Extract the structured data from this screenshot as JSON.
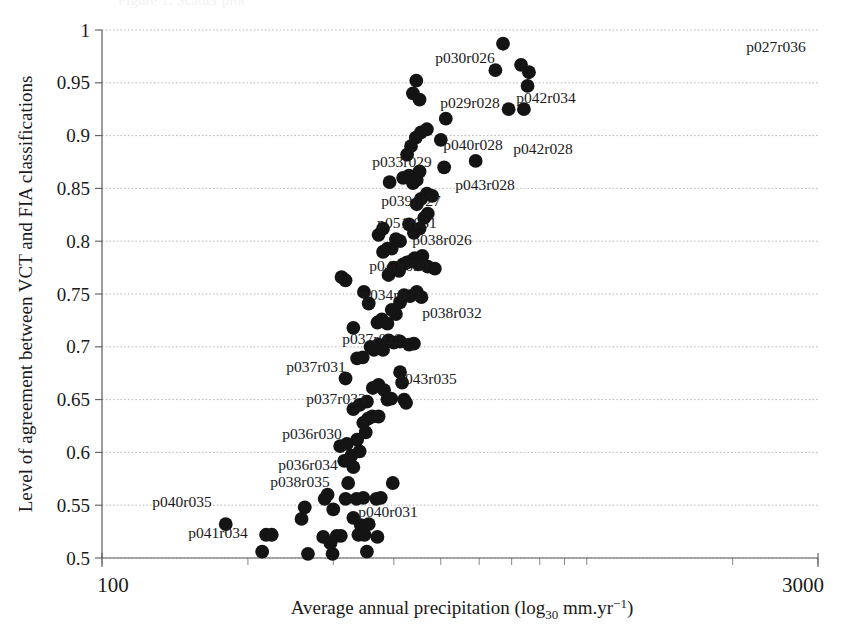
{
  "chart_data": {
    "type": "scatter",
    "title": "",
    "xlabel": "Average annual precipitation (log30 mm.yr-1)",
    "xlabel_parts": {
      "pre": "Average annual precipitation (log",
      "sub": "30",
      "mid": " mm.yr",
      "sup": "−1",
      "post": ")"
    },
    "ylabel": "Level of agreement between VCT and FIA classifications",
    "xscale": "log",
    "xlim": [
      100,
      3000
    ],
    "ylim": [
      0.5,
      1.0
    ],
    "xticks": [
      100,
      3000
    ],
    "xtick_labels": [
      "100",
      "3000"
    ],
    "yticks": [
      0.5,
      0.55,
      0.6,
      0.65,
      0.7,
      0.75,
      0.8,
      0.85,
      0.9,
      0.95,
      1
    ],
    "ytick_labels": [
      "0.5",
      "0.55",
      "0.6",
      "0.65",
      "0.7",
      "0.75",
      "0.8",
      "0.85",
      "0.9",
      "0.95",
      "1"
    ],
    "grid": true,
    "grid_axis": "y",
    "legend": null,
    "marker": {
      "shape": "circle",
      "color": "#141414",
      "size": 7.4
    },
    "points": [
      {
        "x": 180,
        "y": 0.532
      },
      {
        "x": 218,
        "y": 0.522
      },
      {
        "x": 224,
        "y": 0.522
      },
      {
        "x": 214,
        "y": 0.506
      },
      {
        "x": 262,
        "y": 0.548
      },
      {
        "x": 258,
        "y": 0.537
      },
      {
        "x": 266,
        "y": 0.504
      },
      {
        "x": 288,
        "y": 0.556
      },
      {
        "x": 292,
        "y": 0.56
      },
      {
        "x": 300,
        "y": 0.546
      },
      {
        "x": 286,
        "y": 0.52
      },
      {
        "x": 296,
        "y": 0.514
      },
      {
        "x": 305,
        "y": 0.521
      },
      {
        "x": 311,
        "y": 0.521
      },
      {
        "x": 299,
        "y": 0.504
      },
      {
        "x": 322,
        "y": 0.571
      },
      {
        "x": 330,
        "y": 0.586
      },
      {
        "x": 318,
        "y": 0.556
      },
      {
        "x": 335,
        "y": 0.556
      },
      {
        "x": 346,
        "y": 0.557
      },
      {
        "x": 330,
        "y": 0.538
      },
      {
        "x": 342,
        "y": 0.531
      },
      {
        "x": 355,
        "y": 0.532
      },
      {
        "x": 338,
        "y": 0.522
      },
      {
        "x": 348,
        "y": 0.522
      },
      {
        "x": 352,
        "y": 0.506
      },
      {
        "x": 398,
        "y": 0.571
      },
      {
        "x": 368,
        "y": 0.556
      },
      {
        "x": 376,
        "y": 0.557
      },
      {
        "x": 370,
        "y": 0.52
      },
      {
        "x": 310,
        "y": 0.606
      },
      {
        "x": 320,
        "y": 0.608
      },
      {
        "x": 327,
        "y": 0.597
      },
      {
        "x": 316,
        "y": 0.592
      },
      {
        "x": 336,
        "y": 0.612
      },
      {
        "x": 340,
        "y": 0.601
      },
      {
        "x": 350,
        "y": 0.619
      },
      {
        "x": 346,
        "y": 0.628
      },
      {
        "x": 354,
        "y": 0.632
      },
      {
        "x": 361,
        "y": 0.634
      },
      {
        "x": 372,
        "y": 0.634
      },
      {
        "x": 330,
        "y": 0.641
      },
      {
        "x": 340,
        "y": 0.645
      },
      {
        "x": 352,
        "y": 0.648
      },
      {
        "x": 362,
        "y": 0.661
      },
      {
        "x": 372,
        "y": 0.664
      },
      {
        "x": 382,
        "y": 0.659
      },
      {
        "x": 388,
        "y": 0.65
      },
      {
        "x": 395,
        "y": 0.651
      },
      {
        "x": 412,
        "y": 0.676
      },
      {
        "x": 416,
        "y": 0.666
      },
      {
        "x": 420,
        "y": 0.65
      },
      {
        "x": 424,
        "y": 0.647
      },
      {
        "x": 318,
        "y": 0.67
      },
      {
        "x": 336,
        "y": 0.689
      },
      {
        "x": 345,
        "y": 0.69
      },
      {
        "x": 330,
        "y": 0.718
      },
      {
        "x": 358,
        "y": 0.7
      },
      {
        "x": 364,
        "y": 0.697
      },
      {
        "x": 372,
        "y": 0.702
      },
      {
        "x": 380,
        "y": 0.697
      },
      {
        "x": 390,
        "y": 0.706
      },
      {
        "x": 400,
        "y": 0.704
      },
      {
        "x": 412,
        "y": 0.705
      },
      {
        "x": 430,
        "y": 0.702
      },
      {
        "x": 440,
        "y": 0.703
      },
      {
        "x": 370,
        "y": 0.723
      },
      {
        "x": 378,
        "y": 0.726
      },
      {
        "x": 388,
        "y": 0.722
      },
      {
        "x": 396,
        "y": 0.735
      },
      {
        "x": 404,
        "y": 0.731
      },
      {
        "x": 412,
        "y": 0.742
      },
      {
        "x": 355,
        "y": 0.741
      },
      {
        "x": 347,
        "y": 0.752
      },
      {
        "x": 420,
        "y": 0.749
      },
      {
        "x": 432,
        "y": 0.748
      },
      {
        "x": 446,
        "y": 0.752
      },
      {
        "x": 456,
        "y": 0.747
      },
      {
        "x": 312,
        "y": 0.766
      },
      {
        "x": 318,
        "y": 0.763
      },
      {
        "x": 390,
        "y": 0.768
      },
      {
        "x": 400,
        "y": 0.775
      },
      {
        "x": 410,
        "y": 0.772
      },
      {
        "x": 418,
        "y": 0.778
      },
      {
        "x": 426,
        "y": 0.78
      },
      {
        "x": 434,
        "y": 0.781
      },
      {
        "x": 442,
        "y": 0.784
      },
      {
        "x": 450,
        "y": 0.778
      },
      {
        "x": 458,
        "y": 0.786
      },
      {
        "x": 470,
        "y": 0.776
      },
      {
        "x": 486,
        "y": 0.774
      },
      {
        "x": 380,
        "y": 0.79
      },
      {
        "x": 388,
        "y": 0.793
      },
      {
        "x": 396,
        "y": 0.793
      },
      {
        "x": 404,
        "y": 0.802
      },
      {
        "x": 412,
        "y": 0.8
      },
      {
        "x": 372,
        "y": 0.806
      },
      {
        "x": 380,
        "y": 0.812
      },
      {
        "x": 430,
        "y": 0.816
      },
      {
        "x": 440,
        "y": 0.808
      },
      {
        "x": 452,
        "y": 0.812
      },
      {
        "x": 462,
        "y": 0.822
      },
      {
        "x": 470,
        "y": 0.826
      },
      {
        "x": 446,
        "y": 0.835
      },
      {
        "x": 455,
        "y": 0.84
      },
      {
        "x": 468,
        "y": 0.845
      },
      {
        "x": 480,
        "y": 0.843
      },
      {
        "x": 392,
        "y": 0.856
      },
      {
        "x": 418,
        "y": 0.86
      },
      {
        "x": 430,
        "y": 0.862
      },
      {
        "x": 438,
        "y": 0.855
      },
      {
        "x": 446,
        "y": 0.858
      },
      {
        "x": 452,
        "y": 0.866
      },
      {
        "x": 508,
        "y": 0.87
      },
      {
        "x": 426,
        "y": 0.882
      },
      {
        "x": 434,
        "y": 0.89
      },
      {
        "x": 444,
        "y": 0.898
      },
      {
        "x": 455,
        "y": 0.903
      },
      {
        "x": 468,
        "y": 0.906
      },
      {
        "x": 500,
        "y": 0.896
      },
      {
        "x": 512,
        "y": 0.916
      },
      {
        "x": 438,
        "y": 0.94
      },
      {
        "x": 452,
        "y": 0.934
      },
      {
        "x": 445,
        "y": 0.952
      },
      {
        "x": 590,
        "y": 0.876
      },
      {
        "x": 672,
        "y": 0.987
      },
      {
        "x": 690,
        "y": 0.925
      },
      {
        "x": 648,
        "y": 0.962
      },
      {
        "x": 732,
        "y": 0.967
      },
      {
        "x": 760,
        "y": 0.96
      },
      {
        "x": 755,
        "y": 0.947
      },
      {
        "x": 742,
        "y": 0.925
      }
    ],
    "annotations": [
      {
        "text": "p030r026",
        "x_px": 465,
        "y_px": 63
      },
      {
        "text": "p029r028",
        "x_px": 470,
        "y_px": 108
      },
      {
        "text": "p042r034",
        "x_px": 546,
        "y_px": 103
      },
      {
        "text": "p040r028",
        "x_px": 473,
        "y_px": 150
      },
      {
        "text": "p042r028",
        "x_px": 543,
        "y_px": 154
      },
      {
        "text": "p033r029",
        "x_px": 402,
        "y_px": 167
      },
      {
        "text": "p043r028",
        "x_px": 485,
        "y_px": 190
      },
      {
        "text": "p039r027",
        "x_px": 411,
        "y_px": 206
      },
      {
        "text": "p051r031",
        "x_px": 407,
        "y_px": 228
      },
      {
        "text": "p038r026",
        "x_px": 442,
        "y_px": 245
      },
      {
        "text": "p040r030",
        "x_px": 399,
        "y_px": 271
      },
      {
        "text": "p034r031",
        "x_px": 392,
        "y_px": 300
      },
      {
        "text": "p038r032",
        "x_px": 452,
        "y_px": 318
      },
      {
        "text": "p037r028",
        "x_px": 372,
        "y_px": 344
      },
      {
        "text": "p037r031",
        "x_px": 316,
        "y_px": 372
      },
      {
        "text": "p043r035",
        "x_px": 427,
        "y_px": 384
      },
      {
        "text": "p037r033",
        "x_px": 336,
        "y_px": 404
      },
      {
        "text": "p036r030",
        "x_px": 312,
        "y_px": 439
      },
      {
        "text": "p036r034",
        "x_px": 308,
        "y_px": 470
      },
      {
        "text": "p038r035",
        "x_px": 300,
        "y_px": 487
      },
      {
        "text": "p040r035",
        "x_px": 182,
        "y_px": 507
      },
      {
        "text": "p041r034",
        "x_px": 218,
        "y_px": 538
      },
      {
        "text": "p040r031",
        "x_px": 388,
        "y_px": 517
      },
      {
        "text": "p027r036",
        "x_px": 776,
        "y_px": 52
      }
    ]
  },
  "axes_geometry": {
    "plot_left": 102,
    "plot_right": 818,
    "plot_top": 30,
    "plot_bottom": 558
  },
  "ghost_caption": "Figure 1: Scatter plot"
}
